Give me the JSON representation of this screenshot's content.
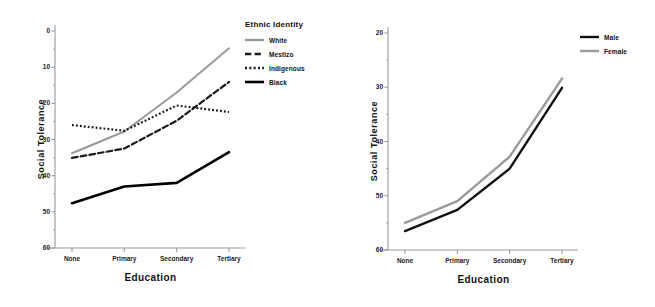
{
  "chart_data": [
    {
      "type": "line",
      "title": "",
      "panel": "left",
      "xlabel": "Education",
      "ylabel": "Social Tolerance",
      "categories": [
        "None",
        "Primary",
        "Secondary",
        "Tertiary"
      ],
      "ylim": [
        0,
        60
      ],
      "yticks": [
        0,
        10,
        20,
        30,
        40,
        50,
        60
      ],
      "grid": false,
      "legend_title": "Ethnic Identity",
      "legend_position": "right",
      "series": [
        {
          "name": "White",
          "values": [
            26.2,
            32.2,
            43.0,
            55.2
          ],
          "color": "#9a9a9a",
          "style": "solid",
          "width": 2.0
        },
        {
          "name": "Mestizo",
          "values": [
            24.9,
            27.5,
            35.2,
            45.9
          ],
          "color": "#1a1a1a",
          "style": "dashed",
          "width": 2.2
        },
        {
          "name": "Indigenous",
          "values": [
            34.0,
            32.4,
            39.4,
            37.6
          ],
          "color": "#1a1a1a",
          "style": "dotted",
          "width": 2.2
        },
        {
          "name": "Black",
          "values": [
            12.4,
            17.0,
            18.0,
            26.5
          ],
          "color": "#000000",
          "style": "solid",
          "width": 2.6
        }
      ]
    },
    {
      "type": "line",
      "title": "",
      "panel": "right",
      "xlabel": "Education",
      "ylabel": "Social Tolerance",
      "categories": [
        "None",
        "Primary",
        "Secondary",
        "Tertiary"
      ],
      "ylim": [
        20,
        60
      ],
      "yticks": [
        20,
        30,
        40,
        50,
        60
      ],
      "grid": false,
      "legend_title": "",
      "legend_position": "right",
      "series": [
        {
          "name": "Male",
          "values": [
            23.5,
            27.4,
            35.0,
            49.9
          ],
          "color": "#111111",
          "style": "solid",
          "width": 2.4
        },
        {
          "name": "Female",
          "values": [
            25.0,
            29.0,
            37.2,
            51.6
          ],
          "color": "#9a9a9a",
          "style": "solid",
          "width": 2.4
        }
      ]
    }
  ],
  "left_chart": {
    "ylabel": "Social Tolerance",
    "xlabel": "Education",
    "yticks": [
      "60",
      "50",
      "40",
      "30",
      "20",
      "10",
      "0"
    ],
    "xticks": [
      "None",
      "Primary",
      "Secondary",
      "Tertiary"
    ],
    "legend": {
      "title": "Ethnic Identity",
      "items": [
        {
          "label": "White"
        },
        {
          "label": "Mestizo"
        },
        {
          "label": "Indigenous"
        },
        {
          "label": "Black"
        }
      ]
    }
  },
  "right_chart": {
    "ylabel": "Social Tolerance",
    "xlabel": "Education",
    "yticks": [
      "60",
      "50",
      "40",
      "30",
      "20"
    ],
    "xticks": [
      "None",
      "Primary",
      "Secondary",
      "Tertiary"
    ],
    "legend": {
      "title": "",
      "items": [
        {
          "label": "Male"
        },
        {
          "label": "Female"
        }
      ]
    }
  },
  "colors": {
    "axis": "#9b9b9b",
    "text": "#111111",
    "gray_series": "#9a9a9a",
    "black_series": "#000000",
    "background": "#ffffff"
  }
}
